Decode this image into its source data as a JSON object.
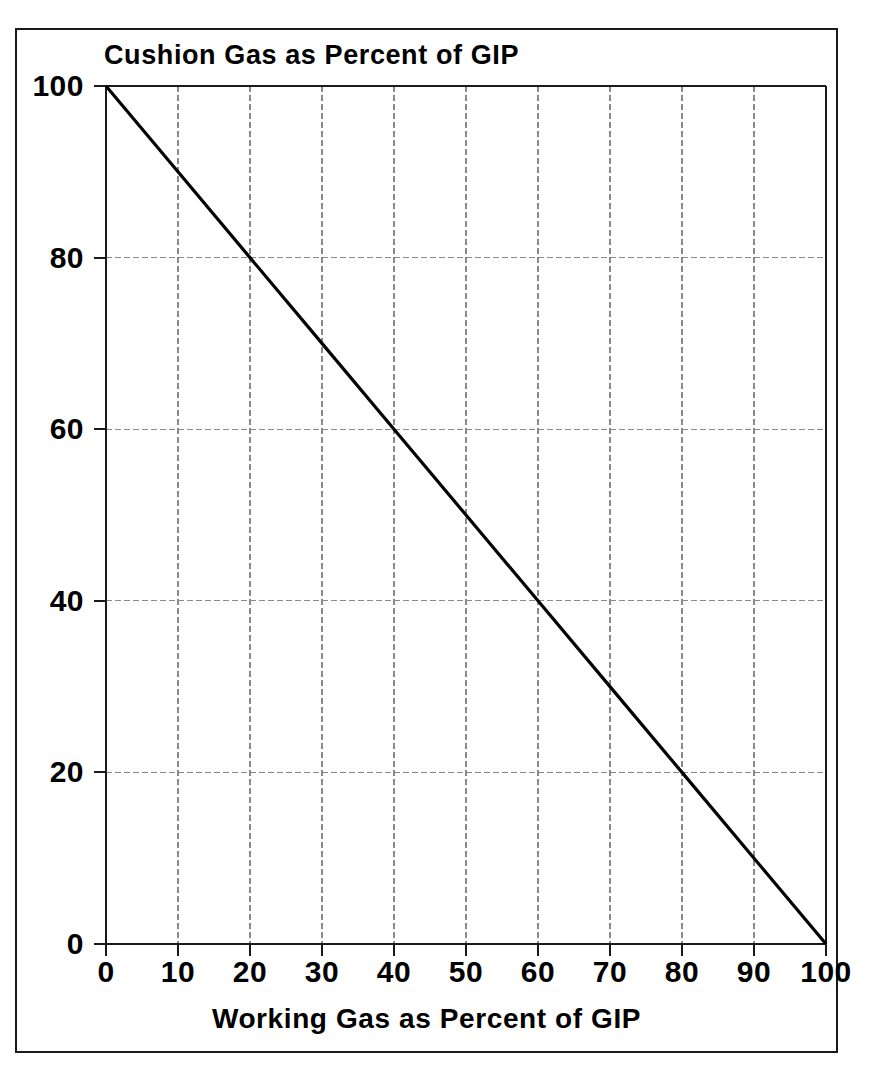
{
  "figure": {
    "background_color": "#ffffff",
    "frame_color": "#1a1a1a",
    "axis_color": "#1a1a1a",
    "grid_color": "#8a8a8a",
    "line_color": "#000000"
  },
  "chart_data": {
    "type": "line",
    "title": "Cushion Gas as Percent of GIP",
    "xlabel": "Working Gas as Percent of GIP",
    "ylabel": "Cushion Gas as Percent of GIP",
    "xlim": [
      0,
      100
    ],
    "ylim": [
      0,
      100
    ],
    "grid": true,
    "legend": "none",
    "x_ticks": [
      0,
      10,
      20,
      30,
      40,
      50,
      60,
      70,
      80,
      90,
      100
    ],
    "x_tick_labels": [
      "0",
      "10",
      "20",
      "30",
      "40",
      "50",
      "60",
      "70",
      "80",
      "90",
      "100"
    ],
    "y_ticks": [
      0,
      20,
      40,
      60,
      80,
      100
    ],
    "y_tick_labels": [
      "0",
      "20",
      "40",
      "60",
      "80",
      "100"
    ],
    "x_minor_grid_step": 10,
    "y_minor_grid_step": 20,
    "series": [
      {
        "name": "Cushion Gas vs Working Gas",
        "x": [
          0,
          10,
          20,
          30,
          40,
          50,
          60,
          70,
          80,
          90,
          100
        ],
        "values": [
          100,
          90,
          80,
          70,
          60,
          50,
          40,
          30,
          20,
          10,
          0
        ]
      }
    ]
  }
}
